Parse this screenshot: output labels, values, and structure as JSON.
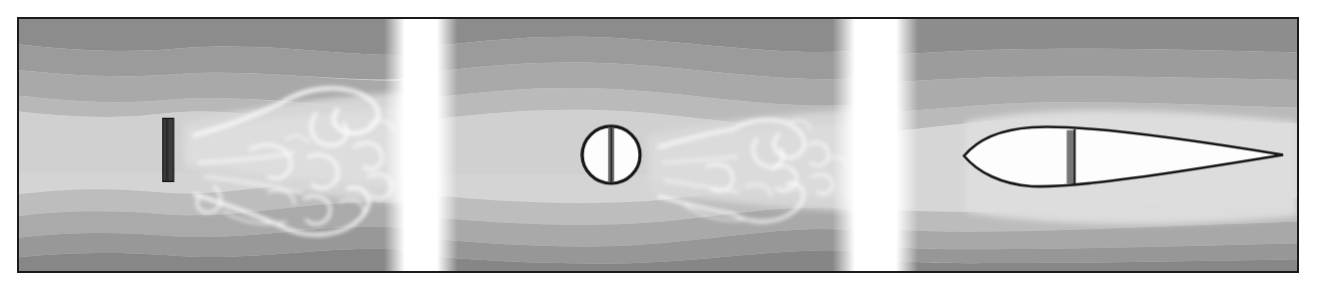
{
  "figure": {
    "kind": "flow-visualization-triptych",
    "caption": "",
    "frame": {
      "border_color": "#1a1a1a",
      "border_width_px": 2,
      "background": "#ffffff"
    },
    "canvas": {
      "width_px": 1282,
      "height_px": 256
    },
    "gap_color": "#ffffff",
    "gaps": [
      {
        "name": "gap-between-panel-1-and-2",
        "x_px": 378,
        "width_px": 50,
        "feather_px": 16
      },
      {
        "name": "gap-between-panel-2-and-3",
        "x_px": 828,
        "width_px": 62,
        "feather_px": 18
      }
    ],
    "bands": {
      "description": "horizontal grey iso-velocity bands, darkest at top and bottom edges, lightest through the mid-channel",
      "colors": [
        "#8b8b8b",
        "#9c9c9c",
        "#ababab",
        "#bcbcbc",
        "#cfcfcf",
        "#dcdcdc",
        "#c6c6c6",
        "#b2b2b2",
        "#a0a0a0",
        "#8f8f8f",
        "#848484"
      ]
    },
    "panels": [
      {
        "id": "panel-1",
        "name": "flat-plate-panel",
        "body": {
          "name": "flat-plate",
          "shape": "rectangle",
          "x_px": 161,
          "y_px": 118,
          "width_px": 11,
          "height_px": 64,
          "fill": "#3a3a3a",
          "stroke": "#141414"
        },
        "wake": {
          "type": "broad-turbulent-wake",
          "spread": "wide",
          "streaks": 14
        }
      },
      {
        "id": "panel-2",
        "name": "circular-cylinder-panel",
        "body": {
          "name": "circular-cylinder",
          "shape": "circle",
          "cx_px": 611,
          "cy_px": 155,
          "r_px": 29,
          "fill": "#ffffff",
          "stroke": "#141414",
          "chord_bar": {
            "x_px": 609,
            "width_px": 6,
            "fill": "#5a5a5a"
          }
        },
        "wake": {
          "type": "narrower-turbulent-wake",
          "spread": "medium",
          "streaks": 13
        }
      },
      {
        "id": "panel-3",
        "name": "streamlined-airfoil-panel",
        "body": {
          "name": "streamlined-airfoil",
          "shape": "airfoil",
          "leading_edge_x_px": 965,
          "trailing_edge_x_px": 1286,
          "chord_y_px": 156,
          "max_thickness_px": 52,
          "max_thickness_x_px": 1030,
          "fill": "#ffffff",
          "stroke": "#141414",
          "spar_bar": {
            "x_px": 1071,
            "width_px": 8,
            "fill": "#6e6e6e",
            "edge": "#1a1a1a"
          }
        },
        "wake": {
          "type": "attached-laminar-flow",
          "spread": "none",
          "streaks": 0
        }
      }
    ]
  }
}
